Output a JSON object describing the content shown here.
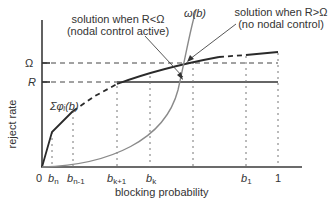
{
  "diagram": {
    "type": "plot-diagram",
    "axes": {
      "xlabel": "blocking probability",
      "ylabel": "reject rate",
      "x_ticks": [
        {
          "base": "0",
          "sub": ""
        },
        {
          "base": "b",
          "sub": "n"
        },
        {
          "base": "b",
          "sub": "n-1"
        },
        {
          "base": "b",
          "sub": "k+1"
        },
        {
          "base": "b",
          "sub": "k"
        },
        {
          "base": "b",
          "sub": "1"
        },
        {
          "base": "1",
          "sub": ""
        }
      ],
      "y_ticks": [
        "Ω",
        "R"
      ]
    },
    "curves": {
      "sum_phi": "Σφᵢ(b)",
      "omega": "ω(b)"
    },
    "annotations": {
      "left_line1": "solution when R<Ω",
      "left_line2": "(nodal control active)",
      "right_line1": "solution when R>Ω",
      "right_line2": "(no nodal control)"
    },
    "colors": {
      "axis": "#3a3a3a",
      "sum_phi_curve": "#2a2a2a",
      "omega_curve": "#8a8a8a",
      "guide": "#555555"
    }
  }
}
